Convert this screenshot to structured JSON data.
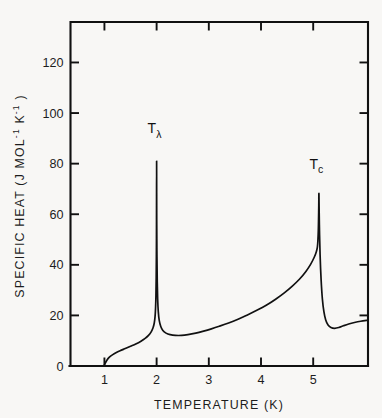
{
  "figure": {
    "background_color": "#f8f7f5",
    "ink_color": "#111111"
  },
  "chart_data": {
    "type": "line",
    "title": "",
    "xlabel": "TEMPERATURE (K)",
    "ylabel": "SPECIFIC HEAT (J MOL",
    "ylabel_sup1": "-1",
    "ylabel_mid": " K",
    "ylabel_sup2": "-1",
    "ylabel_end": " )",
    "xlim": [
      0.35,
      6.05
    ],
    "ylim": [
      0,
      136
    ],
    "xticks": [
      1,
      2,
      3,
      4,
      5
    ],
    "xtick_labels": [
      "1",
      "2",
      "3",
      "4",
      "5"
    ],
    "yticks": [
      0,
      20,
      40,
      60,
      80,
      100,
      120
    ],
    "ytick_labels": [
      "0",
      "20",
      "40",
      "60",
      "80",
      "100",
      "120"
    ],
    "grid": false,
    "legend": null,
    "tick_direction": "in",
    "frame": "box",
    "annotations": [
      {
        "name": "lambda-transition",
        "text": "T",
        "sub": "λ",
        "x": 2.0,
        "y": 92
      },
      {
        "name": "critical-temperature",
        "text": "T",
        "sub": "c",
        "x": 5.1,
        "y": 78
      }
    ],
    "series": [
      {
        "name": "specific heat",
        "color": "#111111",
        "points": [
          [
            1.0,
            0.5
          ],
          [
            1.05,
            2.4
          ],
          [
            1.1,
            3.6
          ],
          [
            1.16,
            4.5
          ],
          [
            1.22,
            5.2
          ],
          [
            1.3,
            6.0
          ],
          [
            1.4,
            6.9
          ],
          [
            1.5,
            7.8
          ],
          [
            1.6,
            8.7
          ],
          [
            1.7,
            9.8
          ],
          [
            1.78,
            10.9
          ],
          [
            1.84,
            12.0
          ],
          [
            1.89,
            13.3
          ],
          [
            1.93,
            15.0
          ],
          [
            1.955,
            17.0
          ],
          [
            1.97,
            19.5
          ],
          [
            1.98,
            23.0
          ],
          [
            1.987,
            28.0
          ],
          [
            1.992,
            35.0
          ],
          [
            1.996,
            46.0
          ],
          [
            1.998,
            58.0
          ],
          [
            2.0,
            81.0
          ],
          [
            2.002,
            58.0
          ],
          [
            2.006,
            44.0
          ],
          [
            2.012,
            33.5
          ],
          [
            2.02,
            26.5
          ],
          [
            2.032,
            21.5
          ],
          [
            2.05,
            18.0
          ],
          [
            2.08,
            15.6
          ],
          [
            2.12,
            14.0
          ],
          [
            2.18,
            13.0
          ],
          [
            2.26,
            12.4
          ],
          [
            2.36,
            12.1
          ],
          [
            2.48,
            12.1
          ],
          [
            2.6,
            12.4
          ],
          [
            2.75,
            13.0
          ],
          [
            2.9,
            13.8
          ],
          [
            3.05,
            14.7
          ],
          [
            3.2,
            15.7
          ],
          [
            3.38,
            17.0
          ],
          [
            3.56,
            18.5
          ],
          [
            3.74,
            20.2
          ],
          [
            3.92,
            22.0
          ],
          [
            4.1,
            24.0
          ],
          [
            4.28,
            26.4
          ],
          [
            4.44,
            28.8
          ],
          [
            4.6,
            31.6
          ],
          [
            4.74,
            34.4
          ],
          [
            4.86,
            37.4
          ],
          [
            4.95,
            40.2
          ],
          [
            5.02,
            43.0
          ],
          [
            5.06,
            45.2
          ],
          [
            5.08,
            47.0
          ],
          [
            5.09,
            49.5
          ],
          [
            5.098,
            53.5
          ],
          [
            5.103,
            58.5
          ],
          [
            5.107,
            63.5
          ],
          [
            5.11,
            68.0
          ],
          [
            5.118,
            56.0
          ],
          [
            5.132,
            44.0
          ],
          [
            5.152,
            34.0
          ],
          [
            5.176,
            26.5
          ],
          [
            5.205,
            21.5
          ],
          [
            5.24,
            18.2
          ],
          [
            5.285,
            16.2
          ],
          [
            5.34,
            15.2
          ],
          [
            5.41,
            14.9
          ],
          [
            5.49,
            15.2
          ],
          [
            5.58,
            15.9
          ],
          [
            5.68,
            16.6
          ],
          [
            5.79,
            17.2
          ],
          [
            5.91,
            17.7
          ],
          [
            6.05,
            18.1
          ]
        ]
      }
    ]
  }
}
